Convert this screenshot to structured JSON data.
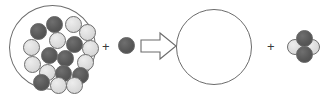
{
  "figure": {
    "title": "",
    "type": "particulate-reaction-diagram",
    "colors": {
      "dark_sphere": "#585858",
      "light_sphere": "#dcdcdc",
      "outline": "#6e6e6e",
      "vessel_outline": "#6d6d6d",
      "background": "#ffffff"
    },
    "operators": {
      "plus_left": "+",
      "plus_right": "+",
      "arrow": "yields-arrow-icon"
    }
  },
  "reactants": {
    "vessel": {
      "name": "reactant-vessel",
      "shape": "circle",
      "cx": 52.5,
      "cy": 47.5,
      "r": 43.5
    },
    "spheres": [
      {
        "id": 1,
        "shade": "dark",
        "x": 37,
        "y": 11,
        "d": 17
      },
      {
        "id": 2,
        "shade": "light",
        "x": 56,
        "y": 11,
        "d": 17
      },
      {
        "id": 3,
        "shade": "light",
        "x": 70,
        "y": 19,
        "d": 17
      },
      {
        "id": 4,
        "shade": "dark",
        "x": 21,
        "y": 18,
        "d": 17
      },
      {
        "id": 5,
        "shade": "light",
        "x": 40,
        "y": 27,
        "d": 17
      },
      {
        "id": 6,
        "shade": "light",
        "x": 14,
        "y": 34,
        "d": 17
      },
      {
        "id": 7,
        "shade": "dark",
        "x": 57,
        "y": 31,
        "d": 17
      },
      {
        "id": 8,
        "shade": "light",
        "x": 73,
        "y": 35,
        "d": 17
      },
      {
        "id": 9,
        "shade": "dark",
        "x": 32,
        "y": 42,
        "d": 17
      },
      {
        "id": 10,
        "shade": "dark",
        "x": 48,
        "y": 45,
        "d": 17
      },
      {
        "id": 11,
        "shade": "light",
        "x": 68,
        "y": 49,
        "d": 17
      },
      {
        "id": 12,
        "shade": "light",
        "x": 15,
        "y": 51,
        "d": 17
      },
      {
        "id": 13,
        "shade": "dark",
        "x": 63,
        "y": 62,
        "d": 17
      },
      {
        "id": 14,
        "shade": "light",
        "x": 30,
        "y": 59,
        "d": 17
      },
      {
        "id": 15,
        "shade": "dark",
        "x": 46,
        "y": 60,
        "d": 17
      },
      {
        "id": 16,
        "shade": "dark",
        "x": 24,
        "y": 69,
        "d": 17
      },
      {
        "id": 17,
        "shade": "light",
        "x": 41,
        "y": 72,
        "d": 17
      },
      {
        "id": 18,
        "shade": "light",
        "x": 57,
        "y": 72,
        "d": 17
      }
    ],
    "free_sphere": {
      "shade": "dark",
      "d": 17,
      "count": 1
    }
  },
  "products": {
    "vessel": {
      "name": "product-vessel",
      "shape": "circle",
      "cx": 214,
      "cy": 47,
      "r": 38,
      "contents": "empty"
    },
    "cluster": {
      "name": "product-cluster",
      "spheres": [
        {
          "id": "left",
          "shade": "light",
          "x": 0,
          "y": 11,
          "d": 16
        },
        {
          "id": "right",
          "shade": "light",
          "x": 17,
          "y": 11,
          "d": 16
        },
        {
          "id": "top",
          "shade": "dark",
          "x": 9,
          "y": 2,
          "d": 17
        },
        {
          "id": "bottom",
          "shade": "dark",
          "x": 9,
          "y": 18,
          "d": 17
        }
      ]
    }
  }
}
